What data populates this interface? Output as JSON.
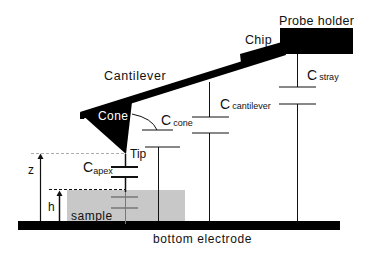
{
  "diagram": {
    "labels": {
      "probe_holder": "Probe holder",
      "chip": "Chip",
      "cantilever": "Cantilever",
      "cone": "Cone",
      "tip": "Tip",
      "sample": "sample",
      "bottom_electrode": "bottom electrode",
      "z": "z",
      "h": "h"
    },
    "capacitors": {
      "apex": {
        "main": "C",
        "sub": "apex"
      },
      "cone": {
        "main": "C",
        "sub": "cone"
      },
      "cantilever": {
        "main": "C",
        "sub": "cantilever"
      },
      "stray": {
        "main": "C",
        "sub": "stray"
      }
    },
    "colors": {
      "structure": "#000000",
      "sample_fill": "#c8c8c8",
      "wire": "#222222",
      "dashed": "#888888"
    }
  }
}
